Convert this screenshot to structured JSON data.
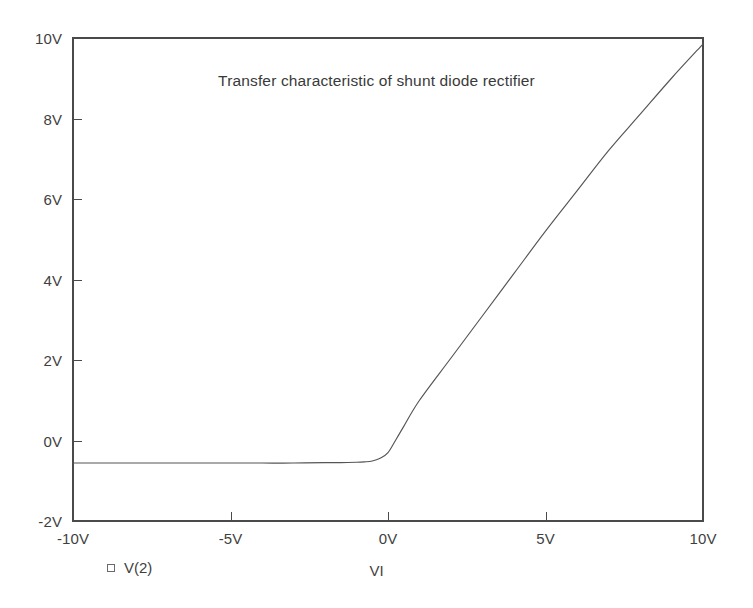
{
  "chart_data": {
    "type": "line",
    "title": "Transfer characteristic of shunt diode rectifier",
    "xlabel": "VI",
    "ylabel": "",
    "xlim": [
      -10,
      10
    ],
    "ylim": [
      -2,
      10
    ],
    "grid": false,
    "legend_position": "bottom-left",
    "x_tick_labels": [
      "-10V",
      "-5V",
      "0V",
      "5V",
      "10V"
    ],
    "x_tick_values": [
      -10,
      -5,
      0,
      5,
      10
    ],
    "y_tick_labels": [
      "-2V",
      "0V",
      "2V",
      "4V",
      "6V",
      "8V",
      "10V"
    ],
    "y_tick_values": [
      -2,
      0,
      2,
      4,
      6,
      8,
      10
    ],
    "x_unit": "V",
    "y_unit": "V",
    "series": [
      {
        "name": "V(2)",
        "marker": "open-square",
        "color": "#555555",
        "x": [
          -10,
          -9,
          -8,
          -7,
          -6,
          -5,
          -4,
          -3,
          -2,
          -1.5,
          -1,
          -0.75,
          -0.5,
          -0.25,
          0,
          0.25,
          0.5,
          1,
          2,
          3,
          4,
          5,
          6,
          7,
          8,
          9,
          10
        ],
        "y": [
          -0.56,
          -0.56,
          -0.56,
          -0.56,
          -0.56,
          -0.56,
          -0.56,
          -0.56,
          -0.55,
          -0.55,
          -0.54,
          -0.53,
          -0.51,
          -0.44,
          -0.3,
          0.02,
          0.35,
          1.0,
          2.05,
          3.1,
          4.15,
          5.2,
          6.2,
          7.2,
          8.1,
          9.0,
          9.85
        ]
      }
    ],
    "annotations": []
  },
  "legend": {
    "marker_name": "open-square-marker",
    "label": "V(2)"
  },
  "colors": {
    "background": "#ffffff",
    "axis": "#4a4a4a",
    "trace": "#555555",
    "text": "#3f3f3f"
  }
}
